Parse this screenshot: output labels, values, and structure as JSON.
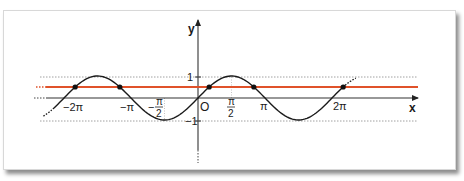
{
  "figure": {
    "axes": {
      "x_label": "x",
      "y_label": "y",
      "origin_label": "O"
    },
    "x_ticks": [
      {
        "label": "−2π",
        "value": -6.2832
      },
      {
        "label": "−π",
        "value": -3.1416
      },
      {
        "label_sign": "−",
        "label_num": "π",
        "label_den": "2",
        "value": -1.5708
      },
      {
        "label_num": "π",
        "label_den": "2",
        "value": 1.5708
      },
      {
        "label": "π",
        "value": 3.1416
      },
      {
        "label": "2π",
        "value": 6.2832
      }
    ],
    "y_ticks": [
      {
        "label": "1",
        "value": 1
      },
      {
        "label": "−1",
        "value": -1
      }
    ],
    "colors": {
      "curve": "#1a1a1a",
      "horizontal_line": "#e0522a",
      "axes": "#333333",
      "guides": "#888888",
      "points": "#111111"
    }
  },
  "chart_data": {
    "type": "line",
    "title": "",
    "xlabel": "x",
    "ylabel": "y",
    "xlim": [
      -7.3,
      8.5
    ],
    "ylim": [
      -2.2,
      3.5
    ],
    "grid": false,
    "series": [
      {
        "name": "y = sin x",
        "function": "sin(x)",
        "x_range": [
          -7.0,
          7.4
        ],
        "style": "solid black, dotted at ends"
      },
      {
        "name": "y = 1/2",
        "function": "0.5",
        "color": "#e0522a"
      }
    ],
    "intersection_points": [
      {
        "x": -5.7596,
        "y": 0.5
      },
      {
        "x": -3.6652,
        "y": 0.5
      },
      {
        "x": 0.5236,
        "y": 0.5
      },
      {
        "x": 2.618,
        "y": 0.5
      },
      {
        "x": 6.8068,
        "y": 0.5
      },
      {
        "x": 8.9012,
        "y": 0.5
      }
    ],
    "tick_labels_x": [
      "−2π",
      "−π",
      "−π/2",
      "O",
      "π/2",
      "π",
      "2π"
    ],
    "tick_labels_y": [
      "1",
      "−1"
    ],
    "reference_lines": [
      {
        "y": 1,
        "style": "dotted"
      },
      {
        "y": -1,
        "style": "dotted"
      }
    ]
  }
}
